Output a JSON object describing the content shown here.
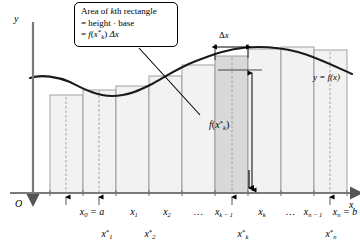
{
  "figure": {
    "axes": {
      "y_label": "y",
      "x_label": "x",
      "origin_label": "O"
    },
    "curve_label": "y = f(x)",
    "callout": {
      "line1": "Area of kth rectangle",
      "line1_pre": "Area of ",
      "line1_k": "k",
      "line1_post": "th rectangle",
      "line2": "= height · base",
      "line3_eq": "=",
      "line3_f": "f",
      "line3_open": "(",
      "line3_x": "x",
      "line3_star": "*",
      "line3_k": "k",
      "line3_close": ")",
      "line3_delta": "Δx"
    },
    "width_annotation": {
      "delta": "Δ",
      "x": "x"
    },
    "height_annotation": {
      "f": "f",
      "open": "(",
      "x": "x",
      "star": "*",
      "k": "k",
      "close": ")"
    },
    "x_axis_labels": [
      {
        "id": "x0",
        "main": "x",
        "sub": "0",
        "suffix": " = a",
        "x": 92,
        "y": 207
      },
      {
        "id": "x1",
        "main": "x",
        "sub": "1",
        "suffix": "",
        "x": 134,
        "y": 207
      },
      {
        "id": "x2",
        "main": "x",
        "sub": "2",
        "suffix": "",
        "x": 167,
        "y": 207
      },
      {
        "id": "dots1",
        "main": "…",
        "sub": "",
        "suffix": "",
        "x": 199,
        "y": 207
      },
      {
        "id": "xk1",
        "main": "x",
        "sub": "k − 1",
        "suffix": "",
        "x": 224,
        "y": 207
      },
      {
        "id": "xk",
        "main": "x",
        "sub": "k",
        "suffix": "",
        "x": 262,
        "y": 207
      },
      {
        "id": "dots2",
        "main": "…",
        "sub": "",
        "suffix": "",
        "x": 291,
        "y": 207
      },
      {
        "id": "xn1",
        "main": "x",
        "sub": "n − 1",
        "suffix": "",
        "x": 313,
        "y": 207
      },
      {
        "id": "xn",
        "main": "x",
        "sub": "n",
        "suffix": " = b",
        "x": 345,
        "y": 207
      }
    ],
    "sample_point_labels": [
      {
        "id": "xs1",
        "main": "x",
        "star": "*",
        "sub": "1",
        "x": 107,
        "y": 229
      },
      {
        "id": "xs2",
        "main": "x",
        "star": "*",
        "sub": "2",
        "x": 150,
        "y": 229
      },
      {
        "id": "xsk",
        "main": "x",
        "star": "*",
        "sub": "k",
        "x": 243,
        "y": 229
      },
      {
        "id": "xsn",
        "main": "x",
        "star": "*",
        "sub": "n",
        "x": 331,
        "y": 229
      }
    ]
  },
  "chart_data": {
    "type": "area",
    "xlabel": "x",
    "ylabel": "y",
    "curve_label": "y = f(x)",
    "grid": false,
    "legend": "none",
    "axis_y_px": 193,
    "axis_origin_px": 33,
    "partition_boundaries_px": [
      50,
      83,
      116,
      149,
      182,
      215,
      248,
      281,
      314,
      347
    ],
    "sample_lines_px": [
      66,
      99,
      232,
      330
    ],
    "highlighted_rectangle_index": 5,
    "highlight_color": "#d9d9d9",
    "rect_fill_color": "#f2f2f2",
    "rect_edge_color": "#808080",
    "curve_color": "#1a1a1a",
    "rectangle_tops_px": [
      95,
      90,
      86,
      76,
      65,
      56,
      49,
      47,
      50,
      59
    ],
    "curve_points_px": [
      [
        30,
        78
      ],
      [
        50,
        75
      ],
      [
        70,
        82
      ],
      [
        90,
        91
      ],
      [
        110,
        96
      ],
      [
        130,
        93
      ],
      [
        150,
        86
      ],
      [
        170,
        76
      ],
      [
        190,
        66
      ],
      [
        210,
        58
      ],
      [
        230,
        52
      ],
      [
        250,
        48
      ],
      [
        270,
        47
      ],
      [
        290,
        49
      ],
      [
        310,
        55
      ],
      [
        330,
        63
      ],
      [
        350,
        72
      ]
    ]
  }
}
